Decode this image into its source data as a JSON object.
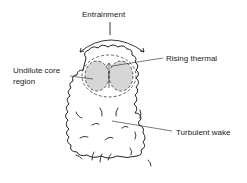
{
  "diagram": {
    "type": "thermal-plume-schematic",
    "labels": {
      "entrainment": "Entrainment",
      "rising_thermal": "Rising thermal",
      "core_line1": "Undilute core",
      "core_line2": "region",
      "turbulent_wake": "Turbulent wake"
    },
    "colors": {
      "stroke": "#222222",
      "core_fill": "#d6d6d6",
      "background": "#ffffff"
    }
  }
}
